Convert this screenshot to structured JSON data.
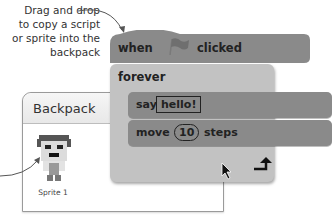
{
  "annotation": {
    "lines": [
      "Drag and drop",
      "to copy a script",
      "or sprite into the",
      "backpack"
    ]
  },
  "backpack": {
    "title": "Backpack",
    "items": [
      {
        "label": "Sprite 1",
        "icon": "pixel-sprite-icon"
      }
    ]
  },
  "script": {
    "hat": {
      "prefix": "when",
      "icon": "green-flag-icon",
      "suffix": "clicked"
    },
    "forever": {
      "label": "forever",
      "icon": "loop-arrow-icon"
    },
    "blocks": [
      {
        "label": "say",
        "input": "hello!"
      },
      {
        "label": "move",
        "input": "10",
        "suffix": "steps"
      }
    ]
  },
  "colors": {
    "block_dark": "#8a8a8a",
    "block_light": "#c2c2c2",
    "text": "#222222"
  }
}
